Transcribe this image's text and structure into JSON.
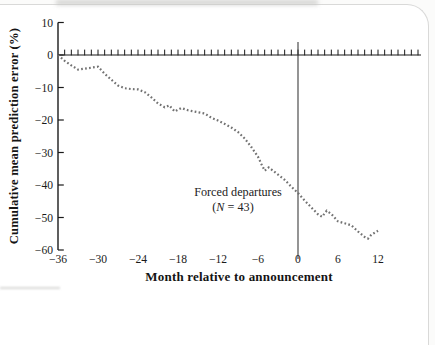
{
  "figure": {
    "kind": "scanned-book-chart"
  },
  "chart_data": {
    "type": "line",
    "title": "",
    "xlabel": "Month relative to announcement",
    "ylabel": "Cumulative mean prediction error (%)",
    "xlim": [
      -36,
      12
    ],
    "ylim": [
      -60,
      10
    ],
    "x_ticks": [
      -36,
      -30,
      -24,
      -18,
      -12,
      -6,
      0,
      6,
      12
    ],
    "y_ticks": [
      10,
      0,
      -10,
      -20,
      -30,
      -40,
      -50,
      -60
    ],
    "grid": false,
    "legend": "none",
    "line_style": "dotted",
    "line_color": "#6a6a6a",
    "axis_color": "#1a1a1a",
    "reference_lines": {
      "vline_x": 0,
      "hline_y": 0,
      "hline_minor_ticks_every_month": true
    },
    "annotation": {
      "line1": "Forced departures",
      "n_open": "(",
      "n_symbol": "N",
      "n_rest": " = 43)"
    },
    "series": [
      {
        "name": "Forced departures (N = 43)",
        "points": [
          [
            -36,
            0
          ],
          [
            -35,
            -1.8
          ],
          [
            -34,
            -3.2
          ],
          [
            -33,
            -4.5
          ],
          [
            -32,
            -4.2
          ],
          [
            -31,
            -3.9
          ],
          [
            -30,
            -3.6
          ],
          [
            -29,
            -5.8
          ],
          [
            -28,
            -7.6
          ],
          [
            -27,
            -9.4
          ],
          [
            -26,
            -10.2
          ],
          [
            -25,
            -10.5
          ],
          [
            -24,
            -10.6
          ],
          [
            -23,
            -11.4
          ],
          [
            -22,
            -13.0
          ],
          [
            -21,
            -14.9
          ],
          [
            -20,
            -16.1
          ],
          [
            -19.3,
            -15.5
          ],
          [
            -18.5,
            -17.4
          ],
          [
            -17.5,
            -16.3
          ],
          [
            -16.5,
            -17.0
          ],
          [
            -15,
            -17.6
          ],
          [
            -14,
            -18.0
          ],
          [
            -13,
            -19.3
          ],
          [
            -12,
            -20.2
          ],
          [
            -11,
            -21.2
          ],
          [
            -10,
            -22.3
          ],
          [
            -9,
            -23.7
          ],
          [
            -8,
            -25.7
          ],
          [
            -7,
            -28.3
          ],
          [
            -6,
            -31.3
          ],
          [
            -5.5,
            -33.5
          ],
          [
            -5,
            -35.6
          ],
          [
            -4.4,
            -34.6
          ],
          [
            -4,
            -35.2
          ],
          [
            -3,
            -36.8
          ],
          [
            -2,
            -38.4
          ],
          [
            -1,
            -40.5
          ],
          [
            0,
            -42.5
          ],
          [
            1,
            -44.8
          ],
          [
            2,
            -46.9
          ],
          [
            3,
            -49.0
          ],
          [
            3.6,
            -49.8
          ],
          [
            4.3,
            -47.9
          ],
          [
            5,
            -48.9
          ],
          [
            6,
            -51.2
          ],
          [
            7,
            -51.8
          ],
          [
            8,
            -52.4
          ],
          [
            9,
            -54.3
          ],
          [
            10,
            -56.0
          ],
          [
            10.5,
            -56.5
          ],
          [
            11,
            -55.3
          ],
          [
            12,
            -54.1
          ]
        ]
      }
    ]
  }
}
